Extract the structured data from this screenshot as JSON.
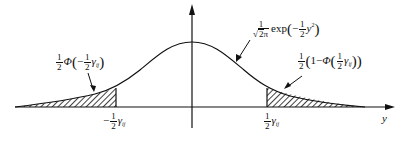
{
  "diagram": {
    "type": "normal-distribution-tails",
    "axis": {
      "x_label": "y",
      "color": "#111111"
    },
    "curve_label": {
      "coef_num": "1",
      "coef_den_sqrt": "2π",
      "func": "exp",
      "minus": "−",
      "inner_num": "1",
      "inner_den": "2",
      "var": "y",
      "exp": "2"
    },
    "left_tail_label": {
      "coef_num": "1",
      "coef_den": "2",
      "func": "Φ",
      "minus": "−",
      "inner_num": "1",
      "inner_den": "2",
      "var": "γ",
      "sub": "ij"
    },
    "right_tail_label": {
      "coef_num": "1",
      "coef_den": "2",
      "one": "1",
      "minus": "−",
      "func": "Φ",
      "inner_num": "1",
      "inner_den": "2",
      "var": "γ",
      "sub": "ij"
    },
    "tick_left": {
      "minus": "−",
      "num": "1",
      "den": "2",
      "var": "γ",
      "sub": "ij"
    },
    "tick_right": {
      "num": "1",
      "den": "2",
      "var": "γ",
      "sub": "ij"
    },
    "hatch_color": "#111111"
  }
}
